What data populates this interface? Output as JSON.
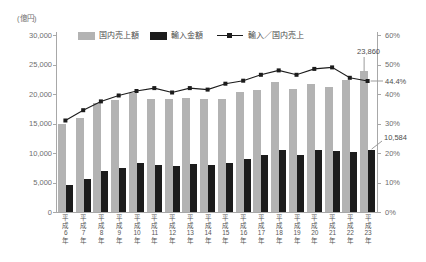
{
  "chart_data": {
    "type": "bar+line",
    "unit": "(億円)",
    "categories": [
      "平成6年",
      "平成7年",
      "平成8年",
      "平成9年",
      "平成10年",
      "平成11年",
      "平成12年",
      "平成13年",
      "平成14年",
      "平成15年",
      "平成16年",
      "平成17年",
      "平成18年",
      "平成19年",
      "平成20年",
      "平成21年",
      "平成22年",
      "平成23年"
    ],
    "series": [
      {
        "name": "国内売上額",
        "type": "bar",
        "color": "#b3b3b3",
        "axis": "left",
        "values": [
          15000,
          16000,
          18400,
          19000,
          20100,
          19100,
          19100,
          19300,
          19200,
          19100,
          20300,
          20600,
          22000,
          20900,
          21700,
          21200,
          22400,
          23860
        ]
      },
      {
        "name": "輸入金額",
        "type": "bar",
        "color": "#1c1c1c",
        "axis": "left",
        "values": [
          4650,
          5520,
          6900,
          7500,
          8240,
          8020,
          7740,
          8100,
          7970,
          8310,
          9030,
          9580,
          10560,
          9720,
          10520,
          10390,
          10190,
          10584
        ]
      },
      {
        "name": "輸入／国内売上",
        "type": "line",
        "color": "#1c1c1c",
        "axis": "right",
        "values": [
          31.0,
          34.5,
          37.5,
          39.5,
          41.0,
          42.0,
          40.5,
          42.0,
          41.5,
          43.5,
          44.5,
          46.5,
          48.0,
          46.5,
          48.5,
          49.0,
          45.5,
          44.4
        ]
      }
    ],
    "y_left": {
      "max": 30000,
      "min": 0,
      "ticks": [
        "30,000",
        "25,000",
        "20,000",
        "15,000",
        "10,000",
        "5,000",
        "0"
      ],
      "tick_values": [
        30000,
        25000,
        20000,
        15000,
        10000,
        5000,
        0
      ]
    },
    "y_right": {
      "max": 60,
      "min": 0,
      "ticks": [
        "60%",
        "50%",
        "40%",
        "30%",
        "20%",
        "10%",
        "0%"
      ],
      "tick_values": [
        60,
        50,
        40,
        30,
        20,
        10,
        0
      ]
    },
    "legend_position": "top",
    "grid": false,
    "annotations": {
      "last_domestic": "23,860",
      "last_import": "10,584",
      "last_ratio": "44.4%"
    }
  },
  "colors": {
    "axis": "#a8a8a8",
    "leader": "#9b9b9b",
    "tick_text": "#6e6e6e",
    "bar_domestic": "#b3b3b3",
    "bar_import": "#1c1c1c",
    "line": "#1c1c1c"
  }
}
